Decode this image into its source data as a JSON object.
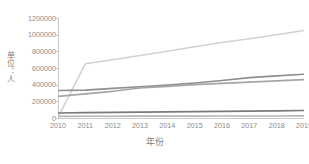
{
  "chart_data": {
    "type": "line",
    "title": "",
    "xlabel": "年份",
    "ylabel": "单位：人",
    "x": [
      2010,
      2011,
      2012,
      2013,
      2014,
      2015,
      2016,
      2017,
      2018,
      2019
    ],
    "xticklabels": [
      "2010",
      "2011",
      "2012",
      "2013",
      "2014",
      "2015",
      "2016",
      "2017",
      "2018",
      "2019"
    ],
    "yticklabels": [
      "1200000",
      "1000000",
      "800000",
      "600000",
      "400000",
      "200000",
      "0"
    ],
    "yticks": [
      1200000,
      1000000,
      800000,
      600000,
      400000,
      200000,
      0
    ],
    "ylim": [
      0,
      1200000
    ],
    "xlim": [
      2010,
      2019
    ],
    "grid": false,
    "legend": "none",
    "series": [
      {
        "name": "series-1",
        "color": "#d2d2d2",
        "values": [
          10000,
          650000,
          700000,
          750000,
          800000,
          855000,
          905000,
          950000,
          1000000,
          1050000
        ]
      },
      {
        "name": "series-2",
        "color": "#8f8f8f",
        "values": [
          330000,
          335000,
          355000,
          375000,
          395000,
          420000,
          450000,
          485000,
          505000,
          525000
        ]
      },
      {
        "name": "series-3",
        "color": "#a6a6a6",
        "values": [
          260000,
          290000,
          320000,
          360000,
          380000,
          400000,
          415000,
          430000,
          445000,
          460000
        ]
      },
      {
        "name": "series-4",
        "color": "#7a7a7a",
        "values": [
          60000,
          65000,
          68000,
          71000,
          74000,
          77000,
          80000,
          83000,
          86000,
          90000
        ]
      },
      {
        "name": "series-5",
        "color": "#b5b5b5",
        "values": [
          20000,
          21000,
          21500,
          22000,
          22500,
          23000,
          23500,
          24000,
          24500,
          25000
        ]
      }
    ]
  }
}
